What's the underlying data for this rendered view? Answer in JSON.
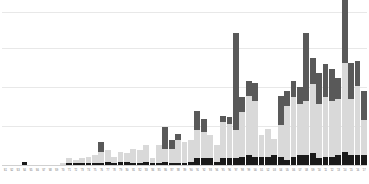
{
  "chart_data": {
    "type": "bar",
    "stacked": true,
    "title": "",
    "subtitle": "",
    "xlabel": "",
    "ylabel": "",
    "grid": true,
    "gridlines_count": 4,
    "legend_position": "none",
    "ylim": [
      0,
      100
    ],
    "yticks": [
      0,
      25,
      50,
      75,
      100
    ],
    "ytick_labels": [],
    "colors": {
      "series_bottom": "#1a1a1a",
      "series_middle": "#d9d9d9",
      "series_top": "#595959",
      "gridline": "#e8e8e8",
      "axis": "#d0d0d0",
      "background": "#ffffff",
      "tick_label": "#6b6b6b"
    },
    "categories": [
      "'61",
      "'62",
      "'63",
      "'64",
      "'65",
      "'66",
      "'67",
      "'68",
      "'69",
      "'70",
      "'71",
      "'72",
      "'73",
      "'74",
      "'75",
      "'76",
      "'77",
      "'78",
      "'79",
      "'80",
      "'81",
      "'82",
      "'83",
      "'84",
      "'85",
      "'86",
      "'87",
      "'88",
      "'89",
      "'90",
      "'91",
      "'92",
      "'93",
      "'94",
      "'95",
      "'96",
      "'97",
      "'98",
      "'99",
      "'00",
      "'01",
      "'02",
      "'03",
      "'04",
      "'05",
      "'06",
      "'07",
      "'08",
      "'09",
      "'10",
      "'11",
      "'12",
      "'13",
      "'14",
      "'15",
      "'16",
      "'17"
    ],
    "series": [
      {
        "name": "bottom",
        "color": "#1a1a1a",
        "values": [
          0,
          0,
          0,
          2,
          0,
          0,
          0,
          0,
          0,
          0,
          1,
          1,
          1,
          1,
          1,
          1,
          2,
          1,
          2,
          2,
          1,
          1,
          2,
          1,
          1,
          2,
          1,
          1,
          1,
          2,
          4,
          4,
          4,
          2,
          4,
          4,
          4,
          5,
          6,
          5,
          5,
          5,
          6,
          5,
          3,
          5,
          6,
          6,
          7,
          4,
          5,
          5,
          6,
          8,
          6,
          6,
          6
        ]
      },
      {
        "name": "middle",
        "color": "#d9d9d9",
        "values": [
          0,
          0,
          0,
          0,
          0,
          0,
          0,
          0,
          0,
          1,
          3,
          2,
          3,
          4,
          5,
          7,
          7,
          4,
          6,
          5,
          9,
          8,
          10,
          3,
          11,
          8,
          9,
          14,
          13,
          13,
          17,
          16,
          14,
          10,
          22,
          21,
          17,
          27,
          36,
          34,
          13,
          17,
          10,
          19,
          33,
          36,
          31,
          33,
          42,
          33,
          36,
          34,
          34,
          54,
          34,
          42,
          21
        ]
      },
      {
        "name": "top",
        "color": "#595959",
        "values": [
          0,
          0,
          0,
          0,
          0,
          0,
          0,
          0,
          0,
          0,
          0,
          0,
          0,
          0,
          0,
          6,
          0,
          0,
          0,
          0,
          0,
          0,
          0,
          0,
          0,
          13,
          5,
          4,
          0,
          0,
          12,
          8,
          0,
          0,
          4,
          4,
          59,
          9,
          9,
          11,
          0,
          0,
          0,
          18,
          9,
          10,
          10,
          41,
          16,
          19,
          20,
          19,
          13,
          62,
          22,
          15,
          18
        ]
      }
    ]
  }
}
